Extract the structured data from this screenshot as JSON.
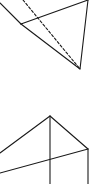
{
  "diagram": {
    "type": "geometric-line-drawing",
    "background": "#ffffff",
    "stroke_color": "#1a1a1a",
    "figures": [
      {
        "name": "upper-triangle-fragment",
        "solid_segments": [
          {
            "from": [
              0,
              3
            ],
            "to": [
              21,
              24
            ]
          },
          {
            "from": [
              21,
              24
            ],
            "to": [
              88,
              0
            ]
          },
          {
            "from": [
              21,
              24
            ],
            "to": [
              80,
              69
            ]
          },
          {
            "from": [
              88,
              0
            ],
            "to": [
              80,
              69
            ]
          }
        ],
        "dashed_segments": [
          {
            "from": [
              23,
              0
            ],
            "to": [
              80,
              69
            ]
          }
        ]
      },
      {
        "name": "lower-pyramid-fragment",
        "solid_segments": [
          {
            "from": [
              0,
              153
            ],
            "to": [
              50,
              116
            ]
          },
          {
            "from": [
              50,
              116
            ],
            "to": [
              88,
              149
            ]
          },
          {
            "from": [
              50,
              116
            ],
            "to": [
              50,
              184
            ]
          },
          {
            "from": [
              88,
              149
            ],
            "to": [
              88,
              184
            ]
          },
          {
            "from": [
              0,
              173
            ],
            "to": [
              88,
              149
            ]
          }
        ],
        "dashed_segments": []
      }
    ]
  }
}
